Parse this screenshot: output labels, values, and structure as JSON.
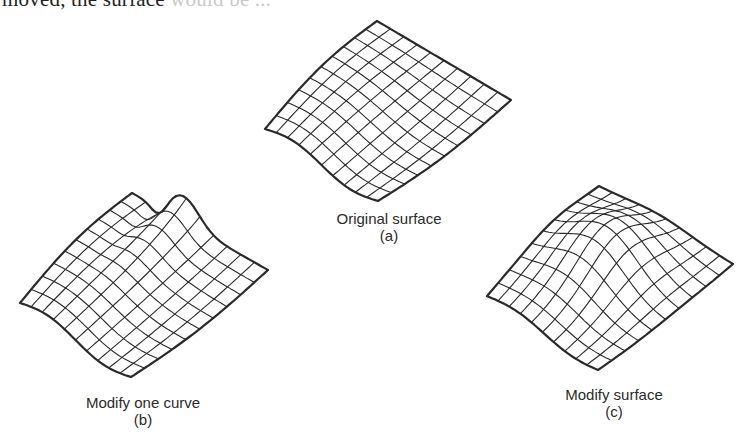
{
  "page": {
    "top_text": "moved, the surface",
    "top_text_faded": " would be ..."
  },
  "figures": [
    {
      "id": "a",
      "caption": "Original surface",
      "sublabel": "(a)",
      "caption_center": [
        389,
        210
      ],
      "corners": {
        "top": [
          377,
          21
        ],
        "right": [
          511,
          100
        ],
        "bottom": [
          378,
          201
        ],
        "left": [
          265,
          129
        ]
      },
      "shape": "original"
    },
    {
      "id": "b",
      "caption": "Modify one curve",
      "sublabel": "(b)",
      "caption_center": [
        143,
        394
      ],
      "corners": {
        "top": [
          132,
          193
        ],
        "right": [
          268,
          270
        ],
        "bottom": [
          131,
          377
        ],
        "left": [
          20,
          303
        ]
      },
      "shape": "one-curve"
    },
    {
      "id": "c",
      "caption": "Modify surface",
      "sublabel": "(c)",
      "caption_center": [
        614,
        386
      ],
      "corners": {
        "top": [
          599,
          186
        ],
        "right": [
          733,
          264
        ],
        "bottom": [
          598,
          370
        ],
        "left": [
          487,
          296
        ]
      },
      "shape": "surface"
    }
  ],
  "style": {
    "line_color": "#2a2a2a",
    "border_width": 2.2,
    "grid_width": 1.1,
    "grid_u": 10,
    "grid_v": 10
  }
}
